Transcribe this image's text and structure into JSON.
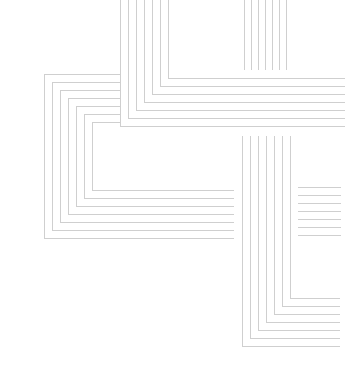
{
  "canvas": {
    "width": 346,
    "height": 374,
    "background": "#ffffff",
    "stroke": "#cfcfcf"
  },
  "groups": [
    {
      "name": "top-center-corner",
      "description": "vertical lines from top turning right",
      "count": 7,
      "start": {
        "x": 120,
        "y": 0
      },
      "corner": {
        "x": 120,
        "y": 126
      },
      "end_x": 345,
      "step_x": 8,
      "step_y": -8,
      "orientation": "down-then-right"
    },
    {
      "name": "left-block-corner",
      "description": "horizontal lines from right turning down then right",
      "count": 7,
      "start_x": 120,
      "top_y": 74,
      "left_x": 44,
      "bottom_y": 238,
      "end_x": 234,
      "step": 8,
      "orientation": "left-down-right"
    },
    {
      "name": "top-right-verticals",
      "description": "short vertical lines at top right",
      "count": 7,
      "x0": 244,
      "step_x": 7,
      "y0": 0,
      "y1": 70,
      "orientation": "vertical"
    },
    {
      "name": "right-horizontals",
      "description": "short horizontal lines on right side",
      "count": 7,
      "x0": 298,
      "x1": 341,
      "y0": 187,
      "step_y": 8,
      "orientation": "horizontal"
    },
    {
      "name": "bottom-right-corner",
      "description": "vertical lines turning right at bottom",
      "count": 7,
      "x0": 242,
      "y0": 136,
      "corner_y": 346,
      "end_x": 340,
      "step": 8,
      "orientation": "down-then-right"
    }
  ]
}
